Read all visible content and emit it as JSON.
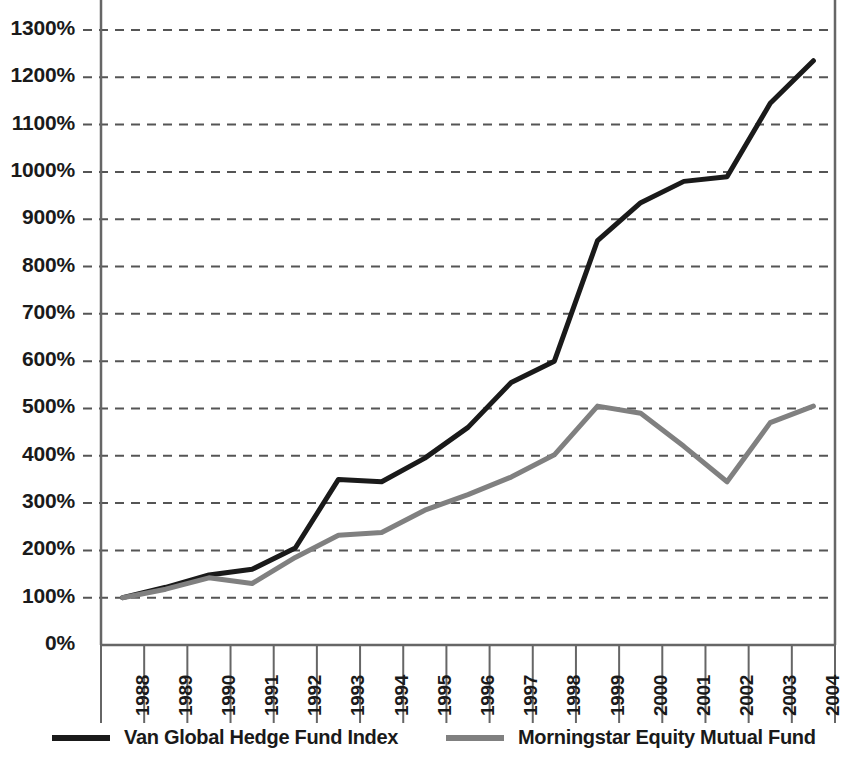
{
  "chart_data": {
    "type": "line",
    "title": "",
    "subtitle": "",
    "xlabel": "",
    "ylabel": "",
    "categories": [
      "1988",
      "1989",
      "1990",
      "1991",
      "1992",
      "1993",
      "1994",
      "1995",
      "1996",
      "1997",
      "1998",
      "1999",
      "2000",
      "2001",
      "2002",
      "2003",
      "2004"
    ],
    "ylim": [
      0,
      1300
    ],
    "ytick_values": [
      0,
      100,
      200,
      300,
      400,
      500,
      600,
      700,
      800,
      900,
      1000,
      1100,
      1200,
      1300
    ],
    "ytick_labels": [
      "0%",
      "100%",
      "200%",
      "300%",
      "400%",
      "500%",
      "600%",
      "700%",
      "800%",
      "900%",
      "1000%",
      "1100%",
      "1200%",
      "1300%"
    ],
    "grid": "horizontal-dashed",
    "legend_position": "bottom",
    "series": [
      {
        "name": "Van Global Hedge Fund Index",
        "color": "#1a1a1a",
        "values": [
          100,
          122,
          148,
          160,
          205,
          350,
          345,
          395,
          460,
          555,
          600,
          855,
          935,
          980,
          990,
          1145,
          1235
        ]
      },
      {
        "name": "Morningstar Equity Mutual Fund",
        "color": "#808080",
        "values": [
          100,
          118,
          142,
          130,
          185,
          232,
          238,
          285,
          318,
          355,
          402,
          505,
          490,
          420,
          345,
          470,
          505
        ]
      }
    ]
  },
  "legend": {
    "entries": [
      {
        "label": "Van Global Hedge Fund Index",
        "color": "#1a1a1a"
      },
      {
        "label": "Morningstar Equity Mutual Fund",
        "color": "#808080"
      }
    ]
  },
  "colors": {
    "series_primary": "#1a1a1a",
    "series_secondary": "#808080",
    "grid": "#555555",
    "axis": "#666666",
    "background": "#ffffff"
  }
}
